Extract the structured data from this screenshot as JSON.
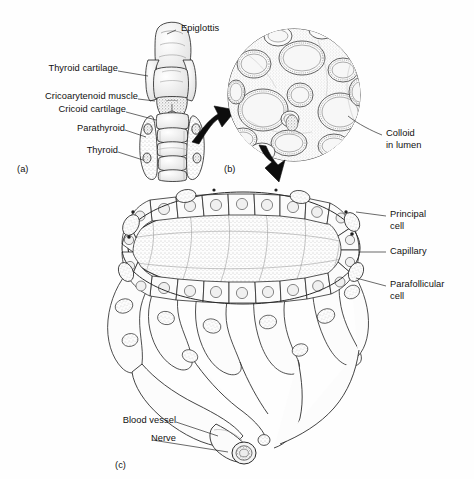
{
  "figure": {
    "panels": [
      {
        "id": "a",
        "tag": "(a)",
        "caption": "Larynx and thyroid gland, anterior view"
      },
      {
        "id": "b",
        "tag": "(b)",
        "caption": "Low-power histology of thyroid follicles"
      },
      {
        "id": "c",
        "tag": "(c)",
        "caption": "Single thyroid follicle with capillary bed"
      }
    ]
  },
  "panel_a": {
    "tag": "(a)",
    "labels": [
      {
        "name": "epiglottis",
        "text": "Epiglottis",
        "side": "right"
      },
      {
        "name": "thyroid-cartilage",
        "text": "Thyroid cartilage",
        "side": "left"
      },
      {
        "name": "cricoarytenoid-muscle",
        "text": "Cricoarytenoid muscle",
        "side": "left"
      },
      {
        "name": "cricoid-cartilage",
        "text": "Cricoid cartilage",
        "side": "left"
      },
      {
        "name": "parathyroid",
        "text": "Parathyroid",
        "side": "left"
      },
      {
        "name": "thyroid",
        "text": "Thyroid",
        "side": "left"
      }
    ]
  },
  "panel_b": {
    "tag": "(b)",
    "labels": [
      {
        "name": "colloid-in-lumen",
        "line1": "Colloid",
        "line2": "in lumen",
        "side": "right"
      }
    ]
  },
  "panel_c": {
    "tag": "(c)",
    "labels": [
      {
        "name": "principal-cell",
        "line1": "Principal",
        "line2": "cell",
        "side": "right"
      },
      {
        "name": "capillary",
        "line1": "Capillary",
        "line2": "",
        "side": "right"
      },
      {
        "name": "parafollicular-cell",
        "line1": "Parafollicular",
        "line2": "cell",
        "side": "right"
      },
      {
        "name": "blood-vessel",
        "text": "Blood vessel",
        "side": "left"
      },
      {
        "name": "nerve",
        "text": "Nerve",
        "side": "left"
      }
    ]
  },
  "colors": {
    "background": "#fefefe",
    "ink": "#1a1a1a",
    "arrow": "#0d0d0d",
    "stipple": "#9a9a9a",
    "fill_light": "#f6f6f6",
    "fill_mid": "#e8e8e8",
    "text": "#111111"
  }
}
